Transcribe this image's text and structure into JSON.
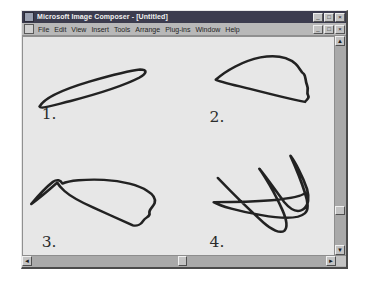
{
  "window": {
    "title": "Microsoft Image Composer - [Untitled]",
    "title_icon": "app-icon",
    "controls": [
      {
        "name": "minimize",
        "glyph": "_"
      },
      {
        "name": "maximize",
        "glyph": "□"
      },
      {
        "name": "close",
        "glyph": "×"
      }
    ],
    "mdi_controls": [
      {
        "name": "minimize",
        "glyph": "_"
      },
      {
        "name": "restore",
        "glyph": "□"
      },
      {
        "name": "close",
        "glyph": "×"
      }
    ]
  },
  "menu": {
    "doc_icon": "document-icon",
    "items": [
      {
        "label": "File"
      },
      {
        "label": "Edit"
      },
      {
        "label": "View"
      },
      {
        "label": "Insert"
      },
      {
        "label": "Tools"
      },
      {
        "label": "Arrange"
      },
      {
        "label": "Plug-ins"
      },
      {
        "label": "Window"
      },
      {
        "label": "Help"
      }
    ]
  },
  "canvas": {
    "background_color": "#e7e7e7",
    "ink_color": "#222222",
    "shapes": [
      {
        "label": "1.",
        "label_x": 18,
        "label_y": 88,
        "description": "thin elongated tilted lens / flattened ellipse",
        "stroke_width": 2.6,
        "path": "M 16 75 C 20 66, 40 56, 64 48 C 86 41, 104 36, 113 35 C 120 35, 120 39, 112 44 C 98 52, 70 62, 46 69 C 28 74, 17 78, 16 75 Z"
      },
      {
        "label": "2.",
        "label_x": 180,
        "label_y": 92,
        "description": "closed triangular blob, pointed left tip, bumpy right edge",
        "stroke_width": 2.6,
        "path": "M 186 46 C 196 36, 212 26, 229 22 C 244 19, 256 22, 263 29 C 267 33, 268 38, 271 40 C 273 42, 272 47, 274 52 C 276 57, 273 60, 275 63 C 277 66, 273 68, 272 70 C 262 68, 240 62, 219 56 C 201 51, 189 48, 186 46 Z"
      },
      {
        "label": "3.",
        "label_x": 18,
        "label_y": 226,
        "description": "irregular closed curve with a tail extending to lower-left",
        "stroke_width": 2.6,
        "path": "M 8 180 C 14 172, 22 162, 29 156 C 33 153, 36 154, 38 158 C 44 155, 60 153, 78 154 C 96 155, 112 160, 120 166 C 126 170, 128 175, 127 179 C 126 183, 121 186, 122 190 C 123 194, 118 194, 116 198 C 114 202, 110 204, 106 203 C 96 198, 80 190, 68 184 C 56 178, 46 172, 40 166 C 36 162, 34 159, 33 157 C 28 162, 18 172, 8 180 Z"
      },
      {
        "label": "4.",
        "label_x": 180,
        "label_y": 226,
        "description": "self-intersecting five-point star-like continuous loop",
        "stroke_width": 2.6,
        "path": "M 188 152 C 200 166, 218 186, 232 200 C 240 208, 248 212, 252 209 C 256 205, 254 196, 250 186 C 243 168, 232 148, 228 142 C 234 150, 244 166, 252 178 C 258 186, 264 190, 270 186 C 276 182, 276 172, 274 164 C 270 150, 262 134, 258 128 C 262 138, 268 154, 272 168 C 275 178, 276 186, 272 190 C 266 196, 250 196, 230 192 C 208 188, 190 182, 184 178 C 194 178, 218 178, 240 176 C 258 174, 270 171, 272 168"
      }
    ]
  },
  "scrollbars": {
    "vertical": {
      "up_glyph": "▲",
      "down_glyph": "▼",
      "thumb_position": 160
    },
    "horizontal": {
      "left_glyph": "◄",
      "right_glyph": "►",
      "thumb_position": 146
    }
  }
}
